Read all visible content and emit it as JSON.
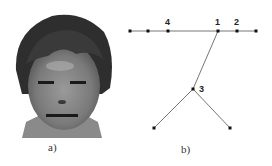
{
  "panels": {
    "a": {
      "caption": "a)",
      "description": "grayscale face photo with marked eye and mouth feature lines"
    },
    "b": {
      "caption": "b)",
      "description": "graph structure of facial landmarks"
    }
  },
  "graph": {
    "nodes": [
      {
        "id": "n0",
        "x": 130,
        "y": 31,
        "label": ""
      },
      {
        "id": "n1",
        "x": 148,
        "y": 31,
        "label": ""
      },
      {
        "id": "n4",
        "x": 168,
        "y": 31,
        "label": "4"
      },
      {
        "id": "n_1",
        "x": 218,
        "y": 31,
        "label": "1"
      },
      {
        "id": "n2",
        "x": 237,
        "y": 31,
        "label": "2"
      },
      {
        "id": "n5",
        "x": 256,
        "y": 31,
        "label": ""
      },
      {
        "id": "n3",
        "x": 193,
        "y": 89,
        "label": "3"
      },
      {
        "id": "n6",
        "x": 154,
        "y": 128,
        "label": ""
      },
      {
        "id": "n7",
        "x": 230,
        "y": 128,
        "label": ""
      }
    ],
    "labels": {
      "l4": "4",
      "l1": "1",
      "l2": "2",
      "l3": "3"
    }
  },
  "colors": {
    "edge": "#666666",
    "node": "#111111"
  }
}
